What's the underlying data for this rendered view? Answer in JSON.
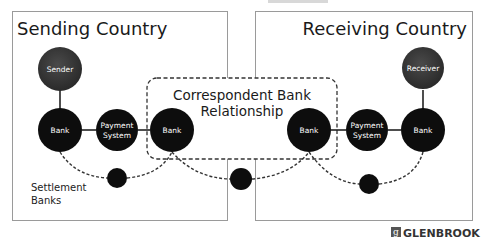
{
  "diagram": {
    "type": "cross-border payment network",
    "regions": {
      "sending": {
        "title": "Sending Country"
      },
      "receiving": {
        "title": "Receiving Country"
      },
      "correspondent": {
        "title_line1": "Correspondent Bank",
        "title_line2": "Relationship"
      }
    },
    "nodes": {
      "sender": {
        "label": "Sender"
      },
      "receiver": {
        "label": "Receiver"
      },
      "bank_send_domestic": {
        "label": "Bank"
      },
      "payment_system_send": {
        "label_line1": "Payment",
        "label_line2": "System"
      },
      "bank_send_correspondent": {
        "label": "Bank"
      },
      "bank_recv_correspondent": {
        "label": "Bank"
      },
      "payment_system_recv": {
        "label_line1": "Payment",
        "label_line2": "System"
      },
      "bank_recv_domestic": {
        "label": "Bank"
      }
    },
    "settlement": {
      "label_line1": "Settlement",
      "label_line2": "Banks"
    },
    "brand": {
      "name": "GLENBROOK",
      "mark": "g"
    },
    "colors": {
      "node": "#0d0d0d",
      "person_node": "#3a3a3a",
      "box_border": "#9a9a9a",
      "dashed": "#333333"
    }
  }
}
